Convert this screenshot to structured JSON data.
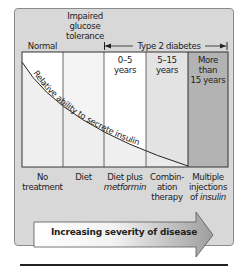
{
  "header": {
    "stages": [
      {
        "label": "Normal"
      },
      {
        "label": "Impaired glucose tolerance"
      },
      {
        "label": "Type 2 diabetes"
      }
    ]
  },
  "columns": [
    {
      "top_label": "",
      "bottom_label_line1": "No",
      "bottom_label_line2": "treatment",
      "bottom_label_line3": "",
      "fill": "#ffffff"
    },
    {
      "top_label": "",
      "bottom_label_line1": "Diet",
      "bottom_label_line2": "",
      "bottom_label_line3": "",
      "fill": "#f3f3f3"
    },
    {
      "top_label_line1": "0–5",
      "top_label_line2": "years",
      "bottom_label_line1": "Diet plus",
      "bottom_label_line2": "metformin",
      "bottom_label_line3": "",
      "fill": "#ffffff"
    },
    {
      "top_label_line1": "5–15",
      "top_label_line2": "years",
      "bottom_label_line1": "Combin-",
      "bottom_label_line2": "ation",
      "bottom_label_line3": "therapy",
      "fill": "#e4e4e4"
    },
    {
      "top_label_line1": "More",
      "top_label_line2": "than",
      "top_label_line3": "15 years",
      "bottom_label_line1": "Multiple",
      "bottom_label_line2": "injections",
      "bottom_label_line3_prefix": "of ",
      "bottom_label_line3_italic": "insulin",
      "fill": "#b5b5b5"
    }
  ],
  "curve": {
    "label": "Relative ability to secrete insulin"
  },
  "arrow": {
    "label": "Increasing severity of disease"
  },
  "colors": {
    "panel_bg": "#d8d8d8",
    "col_dark": "#b5b5b5",
    "col_mid": "#e4e4e4",
    "under_curve": "#e9e9e9",
    "line": "#333333"
  }
}
